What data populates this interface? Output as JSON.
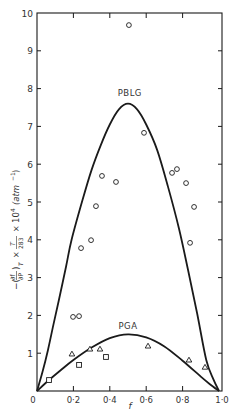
{
  "chart_data": {
    "type": "scatter",
    "title": "",
    "xlabel": "f",
    "ylabel": "−(∂f/∂P)_T × T/283 × 10⁴ (atm⁻¹)",
    "ylabel_parts": {
      "prefix": "−(",
      "num": "∂f",
      "den": "∂P",
      "sub": "T",
      "frac_num": "T",
      "frac_den": "283",
      "times": "×",
      "power": "10",
      "exp": "4",
      "unit": "(atm",
      "unit_exp": "−1",
      "unit_close": ")"
    },
    "xlim": [
      0,
      1.0
    ],
    "ylim": [
      0,
      10
    ],
    "x_ticks": [
      0,
      0.2,
      0.4,
      0.6,
      0.8,
      1.0
    ],
    "x_tick_labels": [
      "0",
      "0·2",
      "0·4",
      "0·6",
      "0·8",
      "1·0"
    ],
    "y_ticks": [
      0,
      1,
      2,
      3,
      4,
      5,
      6,
      7,
      8,
      9,
      10
    ],
    "y_tick_labels": [
      "0",
      "1",
      "2",
      "3",
      "4",
      "5",
      "6",
      "7",
      "8",
      "9",
      "10"
    ],
    "grid": false,
    "annotations": [
      {
        "text": "PBLG",
        "x": 0.51,
        "y": 7.8
      },
      {
        "text": "PGA",
        "x": 0.5,
        "y": 1.65
      }
    ],
    "series": [
      {
        "name": "PBLG (curve)",
        "type": "line",
        "x": [
          0,
          0.03,
          0.06,
          0.09,
          0.12,
          0.16,
          0.19,
          0.25,
          0.3,
          0.35,
          0.4,
          0.45,
          0.5,
          0.55,
          0.6,
          0.66,
          0.72,
          0.78,
          0.83,
          0.88,
          0.93,
          0.97,
          1.0
        ],
        "values": [
          0,
          0.5,
          1.08,
          1.75,
          2.4,
          3.3,
          4.0,
          5.05,
          5.85,
          6.5,
          7.05,
          7.45,
          7.6,
          7.45,
          7.05,
          6.38,
          5.4,
          4.3,
          3.2,
          2.05,
          0.82,
          0.3,
          0
        ]
      },
      {
        "name": "PGA (curve)",
        "type": "line",
        "x": [
          0,
          0.066,
          0.13,
          0.2,
          0.3,
          0.4,
          0.5,
          0.6,
          0.7,
          0.8,
          0.9,
          0.95,
          1.0
        ],
        "values": [
          0,
          0.29,
          0.55,
          0.82,
          1.15,
          1.4,
          1.5,
          1.42,
          1.18,
          0.8,
          0.38,
          0.18,
          0
        ]
      },
      {
        "name": "circles",
        "marker": "circle",
        "x": [
          0.505,
          0.588,
          0.357,
          0.434,
          0.324,
          0.297,
          0.242,
          0.198,
          0.231,
          0.742,
          0.769,
          0.819,
          0.863,
          0.841
        ],
        "values": [
          9.68,
          6.83,
          5.69,
          5.53,
          4.89,
          3.99,
          3.78,
          1.96,
          1.98,
          5.77,
          5.87,
          5.5,
          4.87,
          3.92
        ]
      },
      {
        "name": "triangles",
        "marker": "triangle",
        "x": [
          0.192,
          0.291,
          0.346,
          0.61,
          0.835,
          0.923
        ],
        "values": [
          0.98,
          1.11,
          1.11,
          1.19,
          0.82,
          0.63
        ]
      },
      {
        "name": "squares",
        "marker": "square",
        "x": [
          0.066,
          0.231,
          0.379
        ],
        "values": [
          0.29,
          0.69,
          0.9
        ]
      }
    ],
    "legend": "none"
  },
  "colors": {
    "ink": "#1a1a1a",
    "text": "#333333",
    "background": "#ffffff"
  }
}
